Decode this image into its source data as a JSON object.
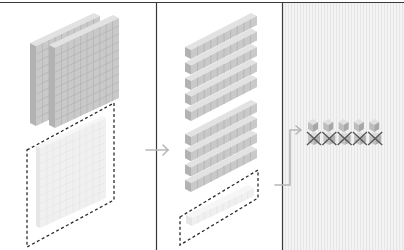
{
  "diagram": {
    "colors": {
      "border": "#3a3a3a",
      "block_face": "#c9c9c9",
      "block_top": "#e2e2e2",
      "block_side": "#b2b2b2",
      "block_grid": "#a9a9a9",
      "faded_face": "#f0f0f0",
      "faded_top": "#f6f6f6",
      "faded_side": "#e6e6e6",
      "faded_grid": "#e0e0e0",
      "dash": "#2a2a2a",
      "arrow": "#b8b8b8",
      "panel3_bg": "#f1f1f1",
      "cross": "#555555"
    },
    "panels": [
      {
        "id": "hundreds",
        "solid_flats": 2,
        "exchanged_flats": 1
      },
      {
        "id": "tens",
        "solid_rods_group_1": 5,
        "solid_rods_group_2": 4,
        "exchanged_rods": 1
      },
      {
        "id": "ones",
        "unit_cubes": 5,
        "crossed_out": 5,
        "cross_glyph": "✕"
      }
    ],
    "arrows": [
      {
        "from": "hundreds",
        "to": "tens",
        "glyph": "arrow-right-icon"
      },
      {
        "from": "tens",
        "to": "ones",
        "glyph": "elbow-arrow-icon"
      }
    ]
  }
}
